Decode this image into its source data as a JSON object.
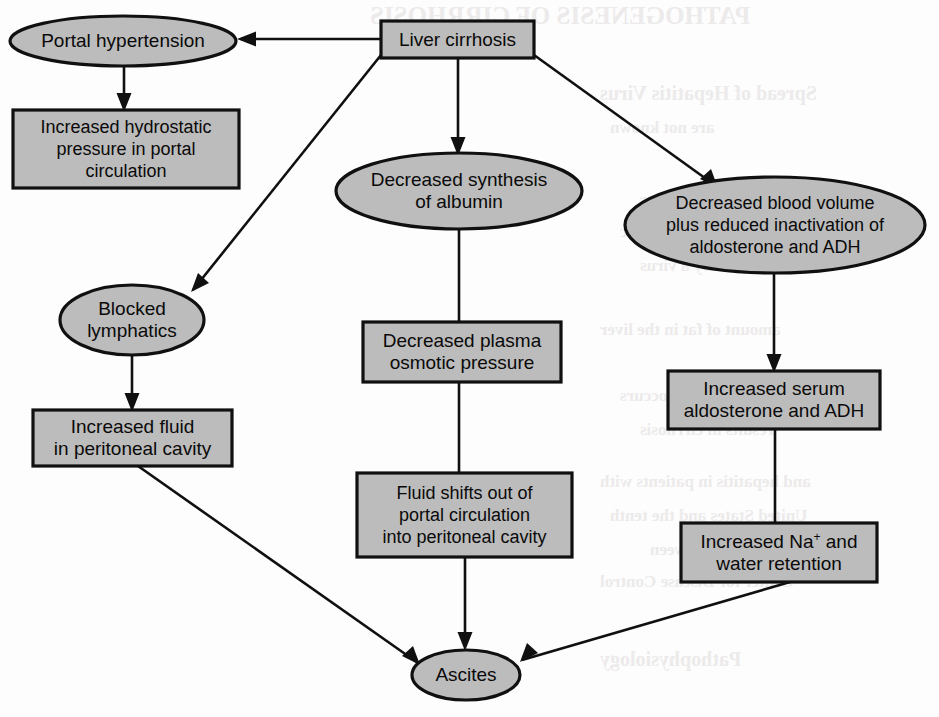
{
  "palette": {
    "shape_fill": "#bcbcbc",
    "stroke": "#101010",
    "background": "#fdfdfd",
    "bleed_text": "#eceaea"
  },
  "background_bleed": [
    {
      "text": "PATHOGENESIS OF CIRRHOSIS",
      "x": 370,
      "y": 2,
      "size": 25
    },
    {
      "text": "Spread of Hepatitis Virus",
      "x": 600,
      "y": 82,
      "size": 20
    },
    {
      "text": "are not known",
      "x": 610,
      "y": 118,
      "size": 17
    },
    {
      "text": "adhesive practices for",
      "x": 640,
      "y": 190,
      "size": 17
    },
    {
      "text": "intermittently and chronic",
      "x": 620,
      "y": 222,
      "size": 17
    },
    {
      "text": "caused by a virus",
      "x": 640,
      "y": 256,
      "size": 17
    },
    {
      "text": "amount of fat in the liver",
      "x": 600,
      "y": 320,
      "size": 17
    },
    {
      "text": "inflammation occurs",
      "x": 620,
      "y": 386,
      "size": 17
    },
    {
      "text": "results in cirrhosis",
      "x": 640,
      "y": 420,
      "size": 17
    },
    {
      "text": "and hepatitis in patients with",
      "x": 600,
      "y": 472,
      "size": 17
    },
    {
      "text": "United States and the tenth",
      "x": 610,
      "y": 506,
      "size": 17
    },
    {
      "text": "in 11 people between",
      "x": 650,
      "y": 540,
      "size": 17
    },
    {
      "text": "Center for Disease Control",
      "x": 600,
      "y": 572,
      "size": 17
    },
    {
      "text": "Pathophysiology",
      "x": 600,
      "y": 648,
      "size": 20
    }
  ],
  "chart_data": {
    "type": "diagram",
    "layout": "flowchart",
    "nodes": [
      {
        "id": "liver-cirrhosis",
        "label": "Liver cirrhosis",
        "shape": "rect",
        "lines": [
          "Liver cirrhosis"
        ],
        "x": 381,
        "y": 21,
        "w": 153,
        "h": 37
      },
      {
        "id": "portal-hypertension",
        "label": "Portal hypertension",
        "shape": "ellipse",
        "lines": [
          "Portal hypertension"
        ],
        "cx": 123,
        "cy": 41,
        "rx": 113,
        "ry": 25
      },
      {
        "id": "increased-hydrostatic-pressure",
        "label": "Increased hydrostatic pressure in portal circulation",
        "shape": "rect",
        "lines": [
          "Increased hydrostatic",
          "pressure in portal",
          "circulation"
        ],
        "x": 13,
        "y": 110,
        "w": 226,
        "h": 78
      },
      {
        "id": "decreased-synthesis-albumin",
        "label": "Decreased synthesis of albumin",
        "shape": "ellipse",
        "lines": [
          "Decreased synthesis",
          "of albumin"
        ],
        "cx": 459,
        "cy": 191,
        "rx": 123,
        "ry": 38
      },
      {
        "id": "decreased-blood-volume",
        "label": "Decreased blood volume plus reduced inactivation of aldosterone and ADH",
        "shape": "ellipse",
        "lines": [
          "Decreased blood volume",
          "plus reduced inactivation of",
          "aldosterone and ADH"
        ],
        "cx": 775,
        "cy": 225,
        "rx": 150,
        "ry": 48
      },
      {
        "id": "blocked-lymphatics",
        "label": "Blocked lymphatics",
        "shape": "ellipse",
        "lines": [
          "Blocked",
          "lymphatics"
        ],
        "cx": 132,
        "cy": 320,
        "rx": 72,
        "ry": 35
      },
      {
        "id": "decreased-plasma-osmotic-pressure",
        "label": "Decreased plasma osmotic pressure",
        "shape": "rect",
        "lines": [
          "Decreased plasma",
          "osmotic pressure"
        ],
        "x": 363,
        "y": 322,
        "w": 198,
        "h": 60
      },
      {
        "id": "increased-serum-aldosterone",
        "label": "Increased serum aldosterone and ADH",
        "shape": "rect",
        "lines": [
          "Increased serum",
          "aldosterone and ADH"
        ],
        "x": 668,
        "y": 371,
        "w": 212,
        "h": 58
      },
      {
        "id": "increased-fluid-peritoneal",
        "label": "Increased fluid in peritoneal cavity",
        "shape": "rect",
        "lines": [
          "Increased fluid",
          "in peritoneal cavity"
        ],
        "x": 33,
        "y": 410,
        "w": 199,
        "h": 56
      },
      {
        "id": "fluid-shifts-out",
        "label": "Fluid shifts out of portal circulation into peritoneal cavity",
        "shape": "rect",
        "lines": [
          "Fluid shifts out of",
          "portal circulation",
          "into peritoneal cavity"
        ],
        "x": 357,
        "y": 473,
        "w": 215,
        "h": 84
      },
      {
        "id": "increased-na-water-retention",
        "label": "Increased Na+ and water retention",
        "shape": "rect",
        "lines": [
          "Increased Na+ and",
          "water retention"
        ],
        "x": 681,
        "y": 523,
        "w": 196,
        "h": 59,
        "superscript": "+"
      },
      {
        "id": "ascites",
        "label": "Ascites",
        "shape": "ellipse",
        "lines": [
          "Ascites"
        ],
        "cx": 466,
        "cy": 675,
        "rx": 54,
        "ry": 25
      }
    ],
    "edges": [
      {
        "from": "liver-cirrhosis",
        "to": "portal-hypertension",
        "path": "M 381 39 L 241 39",
        "arrow_at": [
          241,
          39
        ],
        "dir": "left"
      },
      {
        "from": "portal-hypertension",
        "to": "increased-hydrostatic-pressure",
        "path": "M 124 66 L 124 106",
        "arrow_at": [
          124,
          108
        ],
        "dir": "down"
      },
      {
        "from": "liver-cirrhosis",
        "to": "blocked-lymphatics",
        "path": "M 381 55 L 193 290",
        "arrow_at": [
          193,
          290
        ],
        "dir": "diag-dl"
      },
      {
        "from": "liver-cirrhosis",
        "to": "decreased-synthesis-albumin",
        "path": "M 458 58 L 458 150",
        "arrow_at": [
          458,
          152
        ],
        "dir": "down"
      },
      {
        "from": "liver-cirrhosis",
        "to": "decreased-blood-volume",
        "path": "M 534 55 L 716 186",
        "arrow_at": [
          716,
          186
        ],
        "dir": "diag-dr"
      },
      {
        "from": "blocked-lymphatics",
        "to": "increased-fluid-peritoneal",
        "path": "M 132 355 L 132 406",
        "arrow_at": [
          132,
          408
        ],
        "dir": "down"
      },
      {
        "from": "decreased-synthesis-albumin",
        "to": "decreased-plasma-osmotic-pressure",
        "path": "M 459 229 L 459 322",
        "arrow_at": null,
        "dir": "none"
      },
      {
        "from": "decreased-plasma-osmotic-pressure",
        "to": "fluid-shifts-out",
        "path": "M 459 382 L 459 473",
        "arrow_at": null,
        "dir": "none"
      },
      {
        "from": "decreased-blood-volume",
        "to": "increased-serum-aldosterone",
        "path": "M 774 273 L 774 367",
        "arrow_at": [
          774,
          369
        ],
        "dir": "down"
      },
      {
        "from": "increased-serum-aldosterone",
        "to": "increased-na-water-retention",
        "path": "M 775 429 L 775 523",
        "arrow_at": null,
        "dir": "none"
      },
      {
        "from": "increased-fluid-peritoneal",
        "to": "ascites",
        "path": "M 138 466 L 418 663",
        "arrow_at": [
          418,
          663
        ],
        "dir": "diag-dr"
      },
      {
        "from": "fluid-shifts-out",
        "to": "ascites",
        "path": "M 465 557 L 465 645",
        "arrow_at": [
          465,
          647
        ],
        "dir": "down"
      },
      {
        "from": "increased-na-water-retention",
        "to": "ascites",
        "path": "M 790 582 L 522 660",
        "arrow_at": [
          522,
          660
        ],
        "dir": "diag-dl"
      }
    ]
  }
}
